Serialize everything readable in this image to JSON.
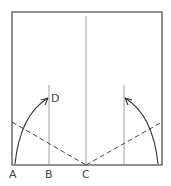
{
  "diagram": {
    "type": "origami-fold-step",
    "colors": {
      "line": "#555555",
      "thin_line": "#777777",
      "label": "#444444",
      "background": "#ffffff"
    },
    "labels": {
      "A": "A",
      "B": "B",
      "C": "C",
      "D": "D"
    },
    "elements": {
      "square": "paper outline",
      "center_crease": "vertical crease at C",
      "left_crease": "vertical crease at B",
      "right_crease": "mirrored vertical crease",
      "left_valley_fold": "dashed fold line toward C",
      "right_valley_fold": "dashed fold line toward C",
      "left_arrow": "arc arrow from A to D",
      "right_arrow": "mirrored arc arrow"
    }
  }
}
